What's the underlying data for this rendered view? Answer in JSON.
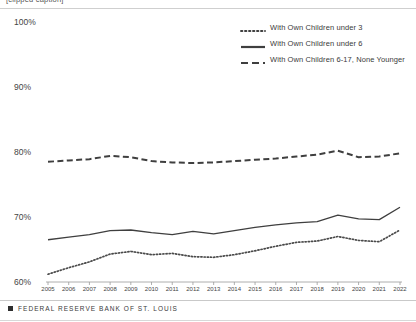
{
  "top_strip": {
    "caption": "[clipped caption]"
  },
  "footer": {
    "mark": "square-bullet-icon",
    "text": "FEDERAL RESERVE BANK OF ST. LOUIS"
  },
  "legend": {
    "position": "top-right",
    "items": [
      {
        "label": "With Own Children under 3",
        "style": "dotted",
        "swatch_name": "legend-swatch-dotted"
      },
      {
        "label": "With Own Children under 6",
        "style": "solid",
        "swatch_name": "legend-swatch-solid"
      },
      {
        "label": "With Own Children 6-17, None Younger",
        "style": "dashed",
        "swatch_name": "legend-swatch-dashed"
      }
    ]
  },
  "chart_data": {
    "type": "line",
    "title": "",
    "subtitle": "",
    "xlabel": "",
    "ylabel": "",
    "grid": false,
    "ylim": [
      60,
      100
    ],
    "ytick_labels": [
      "60%",
      "70%",
      "80%",
      "90%",
      "100%"
    ],
    "ytick_values": [
      60,
      70,
      80,
      90,
      100
    ],
    "x": [
      2005,
      2006,
      2007,
      2008,
      2009,
      2010,
      2011,
      2012,
      2013,
      2014,
      2015,
      2016,
      2017,
      2018,
      2019,
      2020,
      2021,
      2022
    ],
    "xtick_labels": [
      "2005",
      "2006",
      "2007",
      "2008",
      "2009",
      "2010",
      "2011",
      "2012",
      "2013",
      "2014",
      "2015",
      "2016",
      "2017",
      "2018",
      "2019",
      "2020",
      "2021",
      "2022"
    ],
    "series": [
      {
        "name": "With Own Children under 3",
        "style": "dotted",
        "color": "#4a4a4a",
        "values": [
          61.2,
          62.2,
          63.1,
          64.3,
          64.7,
          64.2,
          64.4,
          63.9,
          63.8,
          64.2,
          64.8,
          65.5,
          66.1,
          66.3,
          67.0,
          66.4,
          66.2,
          68.0
        ]
      },
      {
        "name": "With Own Children under 6",
        "style": "solid",
        "color": "#3f3f3f",
        "values": [
          66.5,
          66.9,
          67.3,
          67.9,
          68.0,
          67.6,
          67.3,
          67.8,
          67.4,
          67.9,
          68.4,
          68.8,
          69.1,
          69.3,
          70.3,
          69.7,
          69.6,
          71.5
        ]
      },
      {
        "name": "With Own Children 6-17, None Younger",
        "style": "dashed",
        "color": "#3f3f3f",
        "values": [
          78.5,
          78.7,
          78.9,
          79.4,
          79.2,
          78.6,
          78.4,
          78.3,
          78.4,
          78.6,
          78.8,
          79.0,
          79.3,
          79.6,
          80.2,
          79.2,
          79.3,
          79.8
        ]
      }
    ]
  }
}
